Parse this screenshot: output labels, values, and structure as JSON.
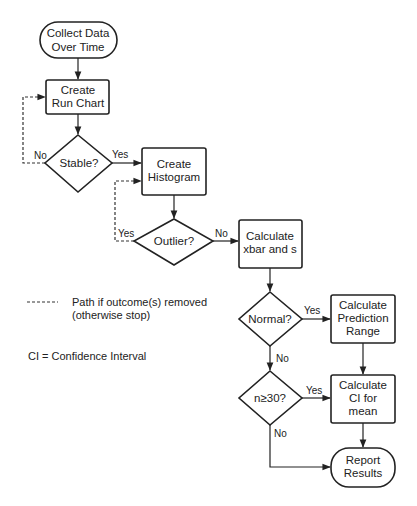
{
  "diagram": {
    "type": "flowchart",
    "nodes": {
      "collect": {
        "shape": "terminator",
        "lines": [
          "Collect Data",
          "Over Time"
        ]
      },
      "run_chart": {
        "shape": "process",
        "lines": [
          "Create",
          "Run Chart"
        ]
      },
      "stable": {
        "shape": "decision",
        "lines": [
          "Stable?"
        ]
      },
      "histogram": {
        "shape": "process",
        "lines": [
          "Create",
          "Histogram"
        ]
      },
      "outlier": {
        "shape": "decision",
        "lines": [
          "Outlier?"
        ]
      },
      "xbar": {
        "shape": "process",
        "lines": [
          "Calculate",
          "xbar and s"
        ]
      },
      "normal": {
        "shape": "decision",
        "lines": [
          "Normal?"
        ]
      },
      "prediction": {
        "shape": "process",
        "lines": [
          "Calculate",
          "Prediction",
          "Range"
        ]
      },
      "n30": {
        "shape": "decision",
        "lines": [
          "n≥30?"
        ]
      },
      "ci_mean": {
        "shape": "process",
        "lines": [
          "Calculate",
          "CI for",
          "mean"
        ]
      },
      "report": {
        "shape": "terminator",
        "lines": [
          "Report",
          "Results"
        ]
      }
    },
    "edge_labels": {
      "stable_no": "No",
      "stable_yes": "Yes",
      "outlier_yes": "Yes",
      "outlier_no": "No",
      "normal_yes": "Yes",
      "normal_no": "No",
      "n30_yes": "Yes",
      "n30_no": "No"
    },
    "edges": [
      {
        "from": "collect",
        "to": "run_chart",
        "style": "solid"
      },
      {
        "from": "run_chart",
        "to": "stable",
        "style": "solid"
      },
      {
        "from": "stable",
        "to": "histogram",
        "label": "Yes",
        "style": "solid"
      },
      {
        "from": "stable",
        "to": "run_chart",
        "label": "No",
        "style": "dashed"
      },
      {
        "from": "histogram",
        "to": "outlier",
        "style": "solid"
      },
      {
        "from": "outlier",
        "to": "histogram",
        "label": "Yes",
        "style": "dashed"
      },
      {
        "from": "outlier",
        "to": "xbar",
        "label": "No",
        "style": "solid"
      },
      {
        "from": "xbar",
        "to": "normal",
        "style": "solid"
      },
      {
        "from": "normal",
        "to": "prediction",
        "label": "Yes",
        "style": "solid"
      },
      {
        "from": "normal",
        "to": "n30",
        "label": "No",
        "style": "solid"
      },
      {
        "from": "prediction",
        "to": "ci_mean",
        "style": "solid"
      },
      {
        "from": "n30",
        "to": "ci_mean",
        "label": "Yes",
        "style": "solid"
      },
      {
        "from": "n30",
        "to": "report",
        "label": "No",
        "style": "solid"
      },
      {
        "from": "ci_mean",
        "to": "report",
        "style": "solid"
      }
    ]
  },
  "legend": {
    "dashed_line_line1": "Path if outcome(s) removed",
    "dashed_line_line2": "(otherwise stop)",
    "abbreviation": "CI = Confidence Interval"
  },
  "colors": {
    "stroke": "#222222",
    "background": "#ffffff"
  }
}
